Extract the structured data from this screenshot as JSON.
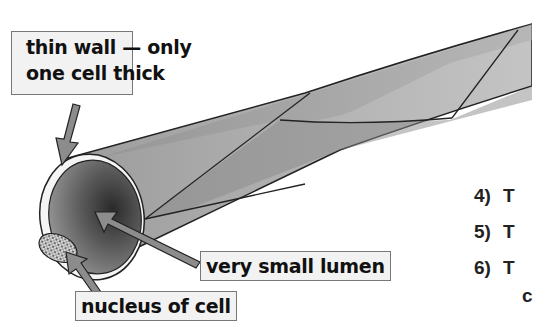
{
  "diagram": {
    "labels": {
      "thin_wall": [
        "thin wall — only",
        "one cell thick"
      ],
      "lumen": "very small lumen",
      "nucleus": "nucleus of cell"
    },
    "numbered_list": [
      {
        "num": "4)",
        "text": "T"
      },
      {
        "num": "5)",
        "text": "T"
      },
      {
        "num": "6)",
        "text": "T",
        "continuation": "c"
      }
    ],
    "colors": {
      "tube_light": "#c8c8c8",
      "tube_mid": "#9a9a9a",
      "tube_dark": "#3a3a3a",
      "arrow": "#8c8c8c",
      "label_bg": "#f2f2f2",
      "outline": "#222222"
    }
  }
}
